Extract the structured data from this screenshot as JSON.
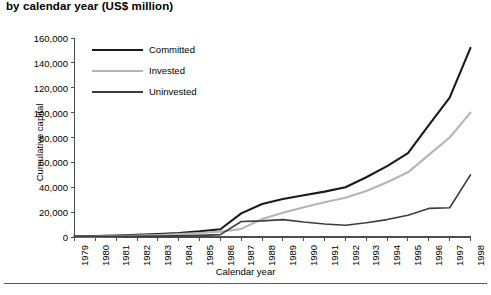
{
  "chart_data": {
    "type": "line",
    "title": "by calendar year (US$ million)",
    "xlabel": "Calendar year",
    "ylabel": "Cumulative capital",
    "grid": false,
    "legend_position": "top-left-inside",
    "categories": [
      "1979",
      "1980",
      "1981",
      "1982",
      "1983",
      "1984",
      "1985",
      "1986",
      "1987",
      "1988",
      "1989",
      "1990",
      "1991",
      "1992",
      "1993",
      "1994",
      "1995",
      "1996",
      "1997",
      "1998"
    ],
    "xlim": [
      "1979",
      "1998"
    ],
    "ylim": [
      0,
      160000
    ],
    "ytick_values": [
      0,
      20000,
      40000,
      60000,
      80000,
      100000,
      120000,
      140000,
      160000
    ],
    "ytick_labels": [
      "0",
      "20,000",
      "40,000",
      "60,000",
      "80,000",
      "100,000",
      "120,000",
      "140,000",
      "160,000"
    ],
    "series": [
      {
        "name": "Committed",
        "color": "#1a1a1a",
        "width": 2.1,
        "values": [
          500,
          800,
          1200,
          1700,
          2300,
          3200,
          4500,
          6200,
          19000,
          26500,
          30500,
          33500,
          36500,
          40000,
          48000,
          57000,
          67500,
          90000,
          112000,
          152000
        ]
      },
      {
        "name": "Invested",
        "color": "#b5b5b5",
        "width": 2.1,
        "values": [
          200,
          400,
          700,
          1100,
          1600,
          2300,
          3200,
          4300,
          6500,
          14500,
          19500,
          24000,
          28000,
          31500,
          37000,
          44000,
          52000,
          66000,
          80000,
          100000
        ]
      },
      {
        "name": "Uninvested",
        "color": "#3c3c3c",
        "width": 1.6,
        "values": [
          300,
          400,
          500,
          600,
          700,
          900,
          1300,
          1900,
          12500,
          13000,
          14000,
          12000,
          10500,
          9500,
          11500,
          14000,
          17500,
          23000,
          23500,
          50000
        ]
      }
    ]
  },
  "axis": {
    "ylabel": "Cumulative capital",
    "xlabel": "Calendar year"
  },
  "legend": {
    "items": [
      {
        "label": "Committed"
      },
      {
        "label": "Invested"
      },
      {
        "label": "Uninvested"
      }
    ]
  }
}
